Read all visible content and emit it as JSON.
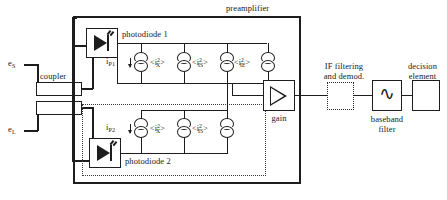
{
  "inputs": {
    "signal_field": "e",
    "signal_field_sub": "S",
    "local_oscillator_field": "e",
    "local_oscillator_field_sub": "L"
  },
  "coupler": {
    "label": "coupler"
  },
  "preamplifier": {
    "label": "preamplifier",
    "photodiode_1": {
      "label": "photodiode 1",
      "current_label": "i",
      "current_sub": "P1"
    },
    "photodiode_2": {
      "label": "photodiode 2",
      "current_label": "i",
      "current_sub": "P2"
    },
    "noise_sources_top": [
      {
        "base": "i",
        "sup": "2",
        "sub": "X",
        "text": "<i²X>"
      },
      {
        "base": "i",
        "sup": "2",
        "sub": "IS",
        "text": "<i²IS>"
      },
      {
        "base": "i",
        "sup": "2",
        "sub": "IE",
        "text": "<i²IE>"
      }
    ],
    "noise_sources_bottom": [
      {
        "base": "i",
        "sup": "2",
        "sub": "X",
        "text": "<i²X>"
      },
      {
        "base": "i",
        "sup": "2",
        "sub": "IS",
        "text": "<i²IS>"
      }
    ],
    "gain": {
      "label": "gain"
    }
  },
  "stages": {
    "if_filter": {
      "line1": "IF filtering",
      "line2": "and demod."
    },
    "baseband_filter": {
      "line1": "baseband",
      "line2": "filter",
      "glyph": "∿"
    },
    "decision_element": {
      "line1": "decision",
      "line2": "element"
    }
  },
  "colors": {
    "ink": "#1d1d1d",
    "background": "#ffffff"
  }
}
